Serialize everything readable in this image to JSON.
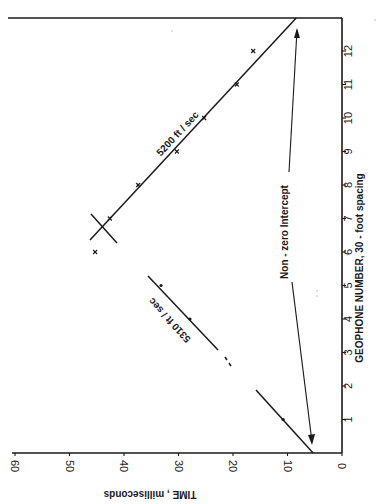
{
  "chart_data": {
    "type": "scatter",
    "title": "",
    "orientation": "rotated 90 degrees counter-clockwise (geophone axis vertical on right, time axis horizontal on bottom)",
    "xlabel": "GEOPHONE NUMBER, 30-foot spacing",
    "ylabel": "TIME, milliseconds",
    "xlim": [
      0,
      13
    ],
    "ylim": [
      0,
      60
    ],
    "x_ticks": [
      1,
      2,
      3,
      4,
      5,
      6,
      7,
      8,
      9,
      10,
      11,
      12
    ],
    "y_ticks": [
      0,
      10,
      20,
      30,
      40,
      50,
      60
    ],
    "grid": false,
    "series": [
      {
        "name": "5200 ft / sec",
        "marker": "x",
        "x": [
          6,
          7,
          8,
          9,
          10,
          11,
          12
        ],
        "y": [
          45.3,
          42.6,
          37.4,
          30.3,
          25.3,
          19.3,
          16.3
        ],
        "fit_line": {
          "x": [
            6.4,
            13.0
          ],
          "y": [
            46.4,
            8.4
          ]
        }
      },
      {
        "name": "5310 ft / sec",
        "marker": "dot",
        "x": [
          1,
          4,
          5
        ],
        "y": [
          10.8,
          27.9,
          33.2
        ],
        "fit_line": {
          "x": [
            0,
            5.3
          ],
          "y": [
            5.3,
            35.6
          ]
        }
      }
    ],
    "annotations": [
      {
        "text": "5200 ft / sec",
        "near": "upper fit line"
      },
      {
        "text": "5310 ft / sec",
        "near": "lower fit line"
      },
      {
        "text": "Non-zero  Intercept",
        "arrows_to": [
          "time intercept at geophone 0 (~5.3 ms)",
          "time intercept at top border (~8.4 ms)"
        ]
      }
    ]
  },
  "axes": {
    "geophone_label": "GEOPHONE   NUMBER,   30 - foot   spacing",
    "time_label": "TIME , milliseconds",
    "geophone_ticks": [
      "1",
      "2",
      "3",
      "4",
      "5",
      "6",
      "7",
      "8",
      "9",
      "10",
      "11",
      "12"
    ],
    "time_ticks": [
      "0",
      "10",
      "20",
      "30",
      "40",
      "50",
      "60"
    ]
  },
  "labels": {
    "line_upper": "5200 ft / sec",
    "line_lower": "5310 ft / sec",
    "intercept_note": "Non - zero     Intercept"
  },
  "style": {
    "ink": "#1a1a1a",
    "paper": "#ffffff"
  }
}
